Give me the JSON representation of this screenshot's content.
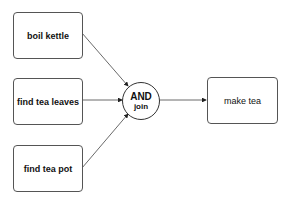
{
  "diagram": {
    "nodes": [
      {
        "id": "boil_kettle",
        "label": "boil kettle"
      },
      {
        "id": "find_tea_leaves",
        "label": "find tea leaves"
      },
      {
        "id": "find_tea_pot",
        "label": "find tea pot"
      },
      {
        "id": "and_join",
        "label_top": "AND",
        "label_bottom": "join"
      },
      {
        "id": "make_tea",
        "label": "make tea"
      }
    ],
    "edges": [
      {
        "from": "boil_kettle",
        "to": "and_join"
      },
      {
        "from": "find_tea_leaves",
        "to": "and_join"
      },
      {
        "from": "find_tea_pot",
        "to": "and_join"
      },
      {
        "from": "and_join",
        "to": "make_tea"
      }
    ]
  }
}
